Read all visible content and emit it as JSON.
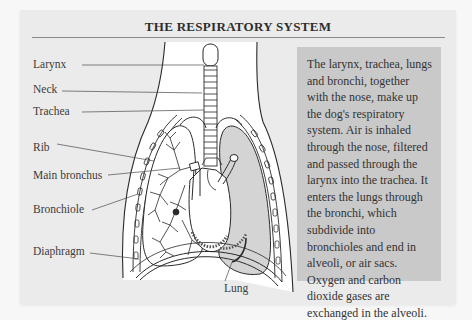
{
  "title": "THE RESPIRATORY SYSTEM",
  "diagram": {
    "labels": {
      "larynx": "Larynx",
      "neck": "Neck",
      "trachea": "Trachea",
      "rib": "Rib",
      "main_bronchus": "Main bronchus",
      "bronchiole": "Bronchiole",
      "diaphragm": "Diaphragm",
      "lung": "Lung"
    }
  },
  "description": "The larynx, trachea, lungs and bronchi, together with the nose, make up the dog's respiratory system. Air is inhaled through the nose, filtered and passed through the larynx into the trachea. It enters the lungs through the bronchi, which subdivide into bronchioles and end in alveoli, or air sacs. Oxygen and carbon dioxide gases are exchanged in the alveoli.",
  "colors": {
    "panel_bg": "#ebebeb",
    "textbox_bg": "#c9c9c9",
    "lung_shade": "#d4d4d4",
    "line": "#2a2a2a"
  }
}
